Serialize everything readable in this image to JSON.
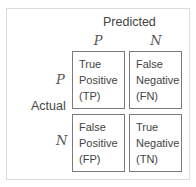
{
  "header": {
    "predicted_label": "Predicted",
    "actual_label": "Actual"
  },
  "columns": [
    {
      "label": "P"
    },
    {
      "label": "N"
    }
  ],
  "rows": [
    {
      "label": "P"
    },
    {
      "label": "N"
    }
  ],
  "cells": [
    {
      "line1": "True",
      "line2": "Positive",
      "line3": "(TP)"
    },
    {
      "line1": "False",
      "line2": "Negative",
      "line3": "(FN)"
    },
    {
      "line1": "False",
      "line2": "Positive",
      "line3": "(FP)"
    },
    {
      "line1": "True",
      "line2": "Negative",
      "line3": "(TN)"
    }
  ]
}
